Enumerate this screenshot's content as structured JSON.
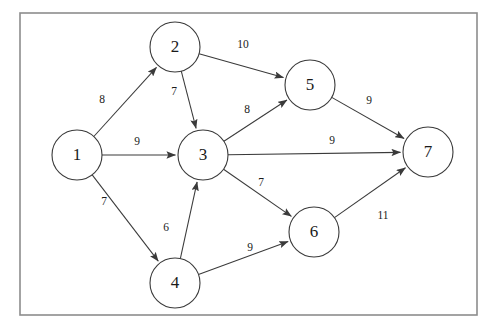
{
  "figure": {
    "kind": "weighted-directed-graph",
    "frame": {
      "x": 20,
      "y": 13,
      "width": 457,
      "height": 302
    }
  },
  "graph_data": {
    "type": "diagram",
    "directed": true,
    "weighted": true,
    "node_radius": 25,
    "nodes": [
      {
        "id": "1",
        "label": "1",
        "x": 77,
        "y": 155
      },
      {
        "id": "2",
        "label": "2",
        "x": 175,
        "y": 47
      },
      {
        "id": "3",
        "label": "3",
        "x": 203,
        "y": 155
      },
      {
        "id": "4",
        "label": "4",
        "x": 175,
        "y": 283
      },
      {
        "id": "5",
        "label": "5",
        "x": 310,
        "y": 85
      },
      {
        "id": "6",
        "label": "6",
        "x": 314,
        "y": 232
      },
      {
        "id": "7",
        "label": "7",
        "x": 428,
        "y": 152
      }
    ],
    "edges": [
      {
        "from": "1",
        "to": "2",
        "weight": "8",
        "lx": 102,
        "ly": 100
      },
      {
        "from": "1",
        "to": "3",
        "weight": "9",
        "lx": 137,
        "ly": 142
      },
      {
        "from": "1",
        "to": "4",
        "weight": "7",
        "lx": 104,
        "ly": 202
      },
      {
        "from": "2",
        "to": "3",
        "weight": "7",
        "lx": 174,
        "ly": 92
      },
      {
        "from": "2",
        "to": "5",
        "weight": "10",
        "lx": 243,
        "ly": 45
      },
      {
        "from": "3",
        "to": "5",
        "weight": "8",
        "lx": 247,
        "ly": 110
      },
      {
        "from": "3",
        "to": "7",
        "weight": "9",
        "lx": 332,
        "ly": 141
      },
      {
        "from": "3",
        "to": "6",
        "weight": "7",
        "lx": 261,
        "ly": 183
      },
      {
        "from": "4",
        "to": "3",
        "weight": "6",
        "lx": 166,
        "ly": 228
      },
      {
        "from": "4",
        "to": "6",
        "weight": "9",
        "lx": 250,
        "ly": 248
      },
      {
        "from": "5",
        "to": "7",
        "weight": "9",
        "lx": 369,
        "ly": 101
      },
      {
        "from": "6",
        "to": "7",
        "weight": "11",
        "lx": 383,
        "ly": 216
      }
    ]
  }
}
